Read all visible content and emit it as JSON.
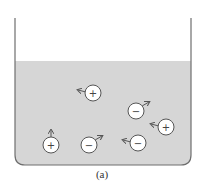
{
  "figure": {
    "caption": "(a)",
    "colors": {
      "liquid": "#d6d6d6",
      "beaker_wall": "#6f6f6f",
      "ion_fill": "#ffffff",
      "ion_stroke": "#555555",
      "arrow": "#555555"
    },
    "beaker": {
      "left_x": 15,
      "right_x": 191,
      "top_y": 18,
      "liquid_surface_y": 61,
      "bottom_y": 165,
      "corner_radius": 10
    },
    "ions": [
      {
        "charge": "+",
        "symbol": "+",
        "cx": 93,
        "cy": 93,
        "r": 8,
        "arrow": "left"
      },
      {
        "charge": "-",
        "symbol": "−",
        "cx": 136,
        "cy": 111,
        "r": 8,
        "arrow": "up-right"
      },
      {
        "charge": "+",
        "symbol": "+",
        "cx": 166,
        "cy": 127,
        "r": 8,
        "arrow": "left"
      },
      {
        "charge": "+",
        "symbol": "+",
        "cx": 51,
        "cy": 145,
        "r": 8,
        "arrow": "up"
      },
      {
        "charge": "-",
        "symbol": "−",
        "cx": 89,
        "cy": 145,
        "r": 8,
        "arrow": "up-right"
      },
      {
        "charge": "-",
        "symbol": "−",
        "cx": 138,
        "cy": 143,
        "r": 8,
        "arrow": "left"
      }
    ]
  }
}
